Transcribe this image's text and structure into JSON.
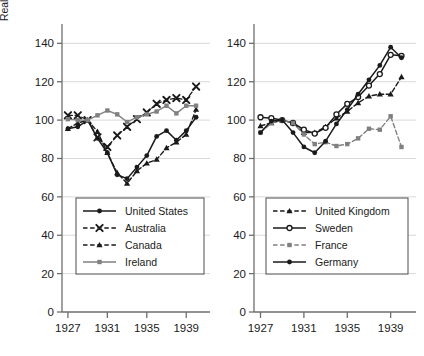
{
  "figure": {
    "ylabel": "Real GDP per capita (1929=100)",
    "ytick_labels": [
      "0",
      "20",
      "40",
      "60",
      "80",
      "100",
      "120",
      "140"
    ],
    "xtick_labels": [
      "1927",
      "1931",
      "1935",
      "1939"
    ]
  },
  "colors": {
    "black": "#1a1a1a",
    "gray": "#808080",
    "axis": "#6e6e6e",
    "grid": "#d9d9d9",
    "background": "#ffffff"
  },
  "chart_data": [
    {
      "type": "line",
      "panel": "left",
      "title": "",
      "xlabel": "",
      "ylabel": "Real GDP per capita (1929=100)",
      "xlim": [
        1926.4,
        1940.6
      ],
      "ylim": [
        0,
        148
      ],
      "xticks": [
        1927,
        1931,
        1935,
        1939
      ],
      "yticks": [
        0,
        20,
        40,
        60,
        80,
        100,
        120,
        140
      ],
      "grid": true,
      "legend_position": "lower-center",
      "x": [
        1927,
        1928,
        1929,
        1930,
        1931,
        1932,
        1933,
        1934,
        1935,
        1936,
        1937,
        1938,
        1939,
        1940
      ],
      "series": [
        {
          "name": "United States",
          "style": "solid-black-filled-circle",
          "values": [
            95.5,
            96.5,
            100,
            90.5,
            83,
            71.5,
            69.5,
            75.5,
            81.5,
            91.5,
            94.5,
            89.5,
            94.5,
            101.5
          ]
        },
        {
          "name": "Australia",
          "style": "dashed-black-cross",
          "values": [
            102.5,
            102.5,
            100,
            91,
            86,
            92,
            96.5,
            100.5,
            104,
            108.5,
            110.5,
            111.5,
            110.5,
            117.5
          ]
        },
        {
          "name": "Canada",
          "style": "dashed-black-triangle",
          "values": [
            95.5,
            98.5,
            100,
            94,
            83,
            72.5,
            67,
            73.5,
            77.5,
            79.5,
            85.5,
            88.5,
            92.5,
            105.5
          ]
        },
        {
          "name": "Ireland",
          "style": "solid-gray-filled-square",
          "values": [
            100.5,
            100,
            100,
            102.5,
            105,
            103,
            99,
            101.5,
            103,
            104.5,
            107.5,
            103.5,
            107.5,
            107.5
          ]
        }
      ]
    },
    {
      "type": "line",
      "panel": "right",
      "title": "",
      "xlabel": "",
      "ylabel": "",
      "xlim": [
        1926.4,
        1940.6
      ],
      "ylim": [
        0,
        148
      ],
      "xticks": [
        1927,
        1931,
        1935,
        1939
      ],
      "yticks": [
        0,
        20,
        40,
        60,
        80,
        100,
        120,
        140
      ],
      "grid": true,
      "legend_position": "lower-center",
      "x": [
        1927,
        1928,
        1929,
        1930,
        1931,
        1932,
        1933,
        1934,
        1935,
        1936,
        1937,
        1938,
        1939,
        1940
      ],
      "series": [
        {
          "name": "United Kingdom",
          "style": "dashed-black-triangle",
          "values": [
            97,
            98.5,
            100,
            98.5,
            93.5,
            93.5,
            96.5,
            101,
            104.5,
            109,
            112.5,
            113.5,
            113.5,
            122.5
          ]
        },
        {
          "name": "Sweden",
          "style": "solid-black-open-circle",
          "values": [
            101.5,
            101,
            100,
            98.5,
            95,
            93,
            96,
            103,
            108.5,
            112,
            118,
            124,
            134,
            133.5
          ]
        },
        {
          "name": "France",
          "style": "dashed-gray-filled-square",
          "values": [
            93.5,
            98.5,
            100,
            98.5,
            92.5,
            87.5,
            88.5,
            86.5,
            87.5,
            90.5,
            95.5,
            95,
            102,
            86
          ]
        },
        {
          "name": "Germany",
          "style": "solid-black-filled-circle",
          "values": [
            93.5,
            99.5,
            100,
            93.5,
            86,
            83,
            89,
            98,
            105.5,
            113.5,
            121,
            128.5,
            138,
            132.5
          ]
        }
      ]
    }
  ],
  "legends": {
    "left": {
      "items": [
        {
          "label": "United States",
          "marker": "filled-circle",
          "dash": "solid",
          "color": "#1a1a1a"
        },
        {
          "label": "Australia",
          "marker": "cross",
          "dash": "dashed",
          "color": "#1a1a1a"
        },
        {
          "label": "Canada",
          "marker": "triangle",
          "dash": "dashed",
          "color": "#1a1a1a"
        },
        {
          "label": "Ireland",
          "marker": "filled-square",
          "dash": "solid",
          "color": "#808080"
        }
      ]
    },
    "right": {
      "items": [
        {
          "label": "United Kingdom",
          "marker": "triangle",
          "dash": "dashed",
          "color": "#1a1a1a"
        },
        {
          "label": "Sweden",
          "marker": "open-circle",
          "dash": "solid",
          "color": "#1a1a1a"
        },
        {
          "label": "France",
          "marker": "filled-square",
          "dash": "dashed",
          "color": "#808080"
        },
        {
          "label": "Germany",
          "marker": "filled-circle",
          "dash": "solid",
          "color": "#1a1a1a"
        }
      ]
    }
  }
}
